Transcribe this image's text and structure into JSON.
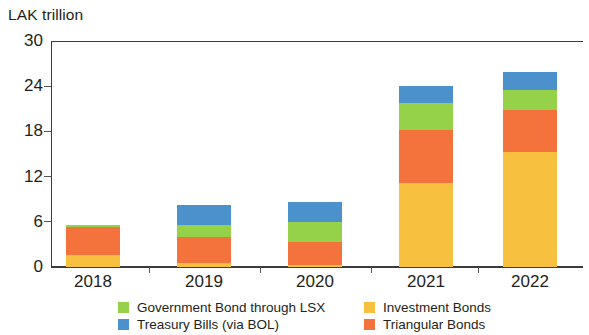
{
  "chart_data": {
    "type": "bar",
    "subtype": "stacked-column",
    "title": "LAK trillion",
    "xlabel": "",
    "ylabel": "LAK trillion",
    "categories": [
      "2018",
      "2019",
      "2020",
      "2021",
      "2022"
    ],
    "ylim": [
      0,
      30
    ],
    "yticks": [
      0,
      6,
      12,
      18,
      24,
      30
    ],
    "ytick_labels": [
      "0",
      "6",
      "12",
      "18",
      "24",
      "30"
    ],
    "grid": false,
    "legend_position": "bottom",
    "stack_order_bottom_to_top": [
      "Investment Bonds",
      "Triangular Bonds",
      "Government Bond through LSX",
      "Treasury Bills (via BOL)"
    ],
    "series": [
      {
        "name": "Investment Bonds",
        "color": "#f7c13f",
        "values": [
          1.6,
          0.5,
          0.3,
          11.2,
          15.3
        ]
      },
      {
        "name": "Triangular Bonds",
        "color": "#f4733c",
        "values": [
          3.7,
          3.5,
          3.0,
          7.0,
          5.6
        ]
      },
      {
        "name": "Government Bond through LSX",
        "color": "#95d24a",
        "values": [
          0.3,
          1.6,
          2.7,
          3.6,
          2.6
        ]
      },
      {
        "name": "Treasury Bills (via BOL)",
        "color": "#4b92cd",
        "values": [
          0.0,
          2.7,
          2.6,
          2.2,
          2.4
        ]
      }
    ],
    "totals": [
      5.6,
      8.3,
      8.6,
      24.0,
      25.9
    ]
  },
  "legend": {
    "rows": [
      [
        {
          "label": "Government Bond through LSX",
          "color": "#95d24a"
        },
        {
          "label": "Investment Bonds",
          "color": "#f7c13f"
        }
      ],
      [
        {
          "label": "Treasury Bills (via BOL)",
          "color": "#4b92cd"
        },
        {
          "label": "Triangular Bonds",
          "color": "#f4733c"
        }
      ]
    ]
  },
  "style": {
    "axis_color": "#3b3b3b",
    "text_color": "#231f20",
    "background": "#ffffff"
  }
}
